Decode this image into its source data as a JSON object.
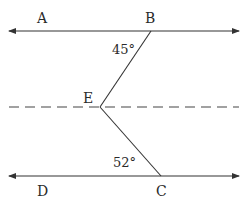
{
  "diagram": {
    "type": "geometry-parallel-lines",
    "points": {
      "A": "A",
      "B": "B",
      "C": "C",
      "D": "D",
      "E": "E"
    },
    "angles": {
      "angle_at_B": "45°",
      "angle_at_C": "52°"
    },
    "lines": [
      {
        "name": "line-AB",
        "style": "solid",
        "arrows": "both"
      },
      {
        "name": "line-through-E",
        "style": "dashed",
        "arrows": "none"
      },
      {
        "name": "line-DC",
        "style": "solid",
        "arrows": "both"
      },
      {
        "name": "segment-BE",
        "style": "solid"
      },
      {
        "name": "segment-EC",
        "style": "solid"
      }
    ],
    "stroke_color": "#333333"
  }
}
